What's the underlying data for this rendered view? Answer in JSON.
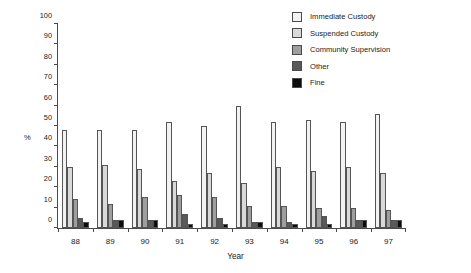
{
  "chart_data": {
    "type": "bar",
    "title": "",
    "xlabel": "Year",
    "ylabel": "%",
    "ylim": [
      0,
      100
    ],
    "yticks": [
      0,
      10,
      20,
      30,
      40,
      50,
      60,
      70,
      80,
      90,
      100
    ],
    "grid": false,
    "legend_position": "top-right",
    "categories": [
      "88",
      "89",
      "90",
      "91",
      "92",
      "93",
      "94",
      "95",
      "96",
      "97"
    ],
    "series": [
      {
        "name": "Immediate Custody",
        "color": "#f2f2f2",
        "values": [
          48,
          48,
          48,
          52,
          50,
          60,
          52,
          53,
          52,
          56
        ]
      },
      {
        "name": "Suspended Custody",
        "color": "#d9d9d9",
        "values": [
          30,
          31,
          29,
          23,
          27,
          22,
          30,
          28,
          30,
          27
        ]
      },
      {
        "name": "Community Supervision",
        "color": "#9e9e9e",
        "values": [
          14,
          12,
          15,
          16,
          15,
          11,
          11,
          10,
          10,
          9
        ]
      },
      {
        "name": "Other",
        "color": "#595959",
        "values": [
          5,
          4,
          4,
          7,
          5,
          3,
          3,
          6,
          4,
          4
        ]
      },
      {
        "name": "Fine",
        "color": "#0d0d0d",
        "values": [
          3,
          4,
          4,
          2,
          2,
          3,
          2,
          2,
          4,
          4
        ]
      }
    ]
  }
}
